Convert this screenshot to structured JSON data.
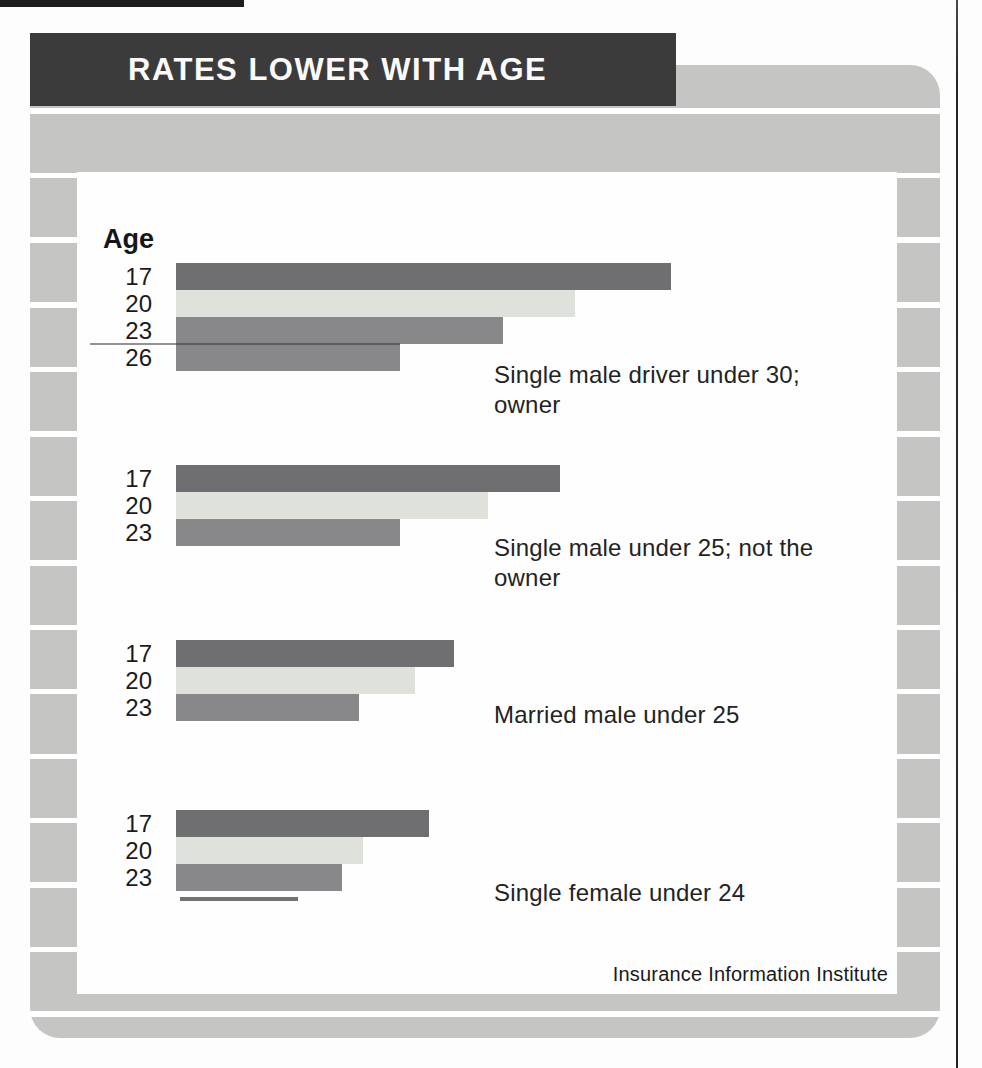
{
  "header": {
    "title": "RATES LOWER WITH AGE"
  },
  "chart": {
    "age_axis_label": "Age",
    "source": "Insurance Information Institute",
    "colors": {
      "dark": "#6f6f71",
      "light": "#dfe2da",
      "medium": "#88888b"
    },
    "groups": [
      {
        "top": 263,
        "caption_top": 360,
        "caption_lines": [
          "Single male driver under 30;",
          "owner"
        ],
        "bars": [
          {
            "age": "17",
            "len": 495,
            "tone": "dark"
          },
          {
            "age": "20",
            "len": 399,
            "tone": "light"
          },
          {
            "age": "23",
            "len": 327,
            "tone": "medium"
          },
          {
            "age": "26",
            "len": 224,
            "tone": "medium"
          }
        ]
      },
      {
        "top": 465,
        "caption_top": 533,
        "caption_lines": [
          "Single male under 25; not the",
          "owner"
        ],
        "bars": [
          {
            "age": "17",
            "len": 384,
            "tone": "dark"
          },
          {
            "age": "20",
            "len": 312,
            "tone": "light"
          },
          {
            "age": "23",
            "len": 224,
            "tone": "medium"
          }
        ]
      },
      {
        "top": 640,
        "caption_top": 700,
        "caption_lines": [
          "Married male under 25"
        ],
        "bars": [
          {
            "age": "17",
            "len": 278,
            "tone": "dark"
          },
          {
            "age": "20",
            "len": 239,
            "tone": "light"
          },
          {
            "age": "23",
            "len": 183,
            "tone": "medium"
          }
        ]
      },
      {
        "top": 810,
        "caption_top": 878,
        "caption_lines": [
          "Single female under 24"
        ],
        "bars": [
          {
            "age": "17",
            "len": 253,
            "tone": "dark"
          },
          {
            "age": "20",
            "len": 187,
            "tone": "light"
          },
          {
            "age": "23",
            "len": 166,
            "tone": "medium"
          }
        ]
      }
    ]
  },
  "chart_data": {
    "type": "bar",
    "orientation": "horizontal",
    "title": "RATES LOWER WITH AGE",
    "xlabel": "relative insurance rate (no numeric scale shown)",
    "ylabel": "Age",
    "legend": "none",
    "grid": false,
    "source": "Insurance Information Institute",
    "groups": [
      {
        "caption": "Single male driver under 30; owner",
        "ages": [
          17,
          20,
          23,
          26
        ],
        "relative_bar_lengths_px": [
          495,
          399,
          327,
          224
        ]
      },
      {
        "caption": "Single male under 25; not the owner",
        "ages": [
          17,
          20,
          23
        ],
        "relative_bar_lengths_px": [
          384,
          312,
          224
        ]
      },
      {
        "caption": "Married male under 25",
        "ages": [
          17,
          20,
          23
        ],
        "relative_bar_lengths_px": [
          278,
          239,
          183
        ]
      },
      {
        "caption": "Single female under 24",
        "ages": [
          17,
          20,
          23
        ],
        "relative_bar_lengths_px": [
          253,
          187,
          166
        ]
      }
    ]
  }
}
